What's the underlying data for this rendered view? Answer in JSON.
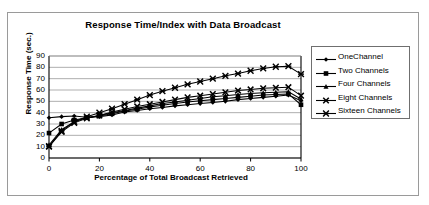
{
  "chart_data": {
    "type": "line",
    "title": "Response Time/Index with Data Broadcast",
    "xlabel": "Percentage of Total Broadcast Retrieved",
    "ylabel": "Response Time (sec.)",
    "xlim": [
      0,
      100
    ],
    "ylim": [
      0,
      90
    ],
    "xticks": [
      0,
      20,
      40,
      60,
      80,
      100
    ],
    "yticks": [
      0,
      10,
      20,
      30,
      40,
      50,
      60,
      70,
      80,
      90
    ],
    "grid": "horizontal",
    "legend_position": "right",
    "x": [
      0,
      5,
      10,
      15,
      20,
      25,
      30,
      35,
      40,
      45,
      50,
      55,
      60,
      65,
      70,
      75,
      80,
      85,
      90,
      95,
      100
    ],
    "series": [
      {
        "name": "OneChannel",
        "marker": "diamond",
        "color": "#000000",
        "values": [
          35.5,
          36.5,
          37.0,
          36.0,
          36.5,
          38.0,
          40.5,
          42.0,
          43.5,
          44.5,
          46.0,
          47.0,
          48.0,
          49.0,
          50.0,
          51.5,
          52.5,
          53.5,
          54.5,
          55.5,
          50.5
        ]
      },
      {
        "name": "Two Channels",
        "marker": "square",
        "color": "#000000",
        "values": [
          22.0,
          30.0,
          33.5,
          35.5,
          37.0,
          39.0,
          41.5,
          43.0,
          45.0,
          46.5,
          48.0,
          49.5,
          50.5,
          51.5,
          52.5,
          53.5,
          54.5,
          55.5,
          56.0,
          56.5,
          47.0
        ]
      },
      {
        "name": "Four Channels",
        "marker": "triangle",
        "color": "#000000",
        "values": [
          11.5,
          25.0,
          32.0,
          35.5,
          37.5,
          40.0,
          42.0,
          44.0,
          46.0,
          48.0,
          49.5,
          51.0,
          52.5,
          54.0,
          55.0,
          56.0,
          57.0,
          57.5,
          58.0,
          58.5,
          52.0
        ]
      },
      {
        "name": "Eight Channels",
        "marker": "x",
        "color": "#000000",
        "values": [
          10.0,
          23.0,
          31.0,
          35.0,
          37.5,
          40.5,
          43.0,
          45.5,
          47.5,
          49.5,
          51.5,
          53.5,
          55.0,
          56.5,
          58.0,
          59.5,
          60.5,
          61.5,
          62.0,
          62.5,
          55.0
        ]
      },
      {
        "name": "Sixteen Channels",
        "marker": "asterisk",
        "color": "#000000",
        "values": [
          10.5,
          24.0,
          32.0,
          36.5,
          40.0,
          43.5,
          47.5,
          51.5,
          55.5,
          59.0,
          62.0,
          65.0,
          67.5,
          70.0,
          72.5,
          74.5,
          77.0,
          79.0,
          80.5,
          81.0,
          74.0
        ]
      }
    ]
  }
}
